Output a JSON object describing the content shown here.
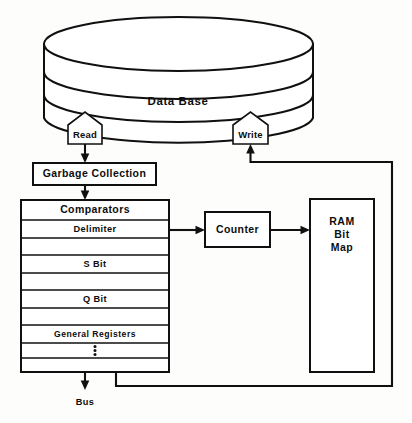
{
  "diagram": {
    "background_color": "#fdfdfb",
    "line_color": "#101010",
    "database": {
      "label": "Data Base",
      "shape": "cylinder"
    },
    "ports": [
      {
        "name": "read-port",
        "label": "Read",
        "shape": "pentagon-up"
      },
      {
        "name": "write-port",
        "label": "Write",
        "shape": "pentagon-up"
      }
    ],
    "garbage_collection": {
      "label": "Garbage Collection"
    },
    "register_stack": {
      "header": "Comparators",
      "rows": [
        {
          "label": "Delimiter"
        },
        {
          "label": ""
        },
        {
          "label": "S  Bit"
        },
        {
          "label": ""
        },
        {
          "label": "Q  Bit"
        },
        {
          "label": ""
        },
        {
          "label": "General  Registers"
        },
        {
          "label": "⋮",
          "glyph": "vertical-ellipsis"
        },
        {
          "label": ""
        }
      ]
    },
    "counter": {
      "label": "Counter"
    },
    "ram": {
      "line1": "RAM",
      "line2": "Bit",
      "line3": "Map"
    },
    "bus": {
      "label": "Bus"
    },
    "connections": [
      {
        "from": "read-port",
        "to": "garbage-collection",
        "style": "arrow-down"
      },
      {
        "from": "garbage-collection",
        "to": "comparators",
        "style": "arrow-down"
      },
      {
        "from": "comparators",
        "to": "counter",
        "style": "arrow-right"
      },
      {
        "from": "counter",
        "to": "ram-bit-map",
        "style": "arrow-right"
      },
      {
        "from": "comparators",
        "to": "bus",
        "style": "arrow-down"
      },
      {
        "from": "bus-tap",
        "to": "write-port",
        "style": "feedback-loop-right"
      }
    ]
  }
}
